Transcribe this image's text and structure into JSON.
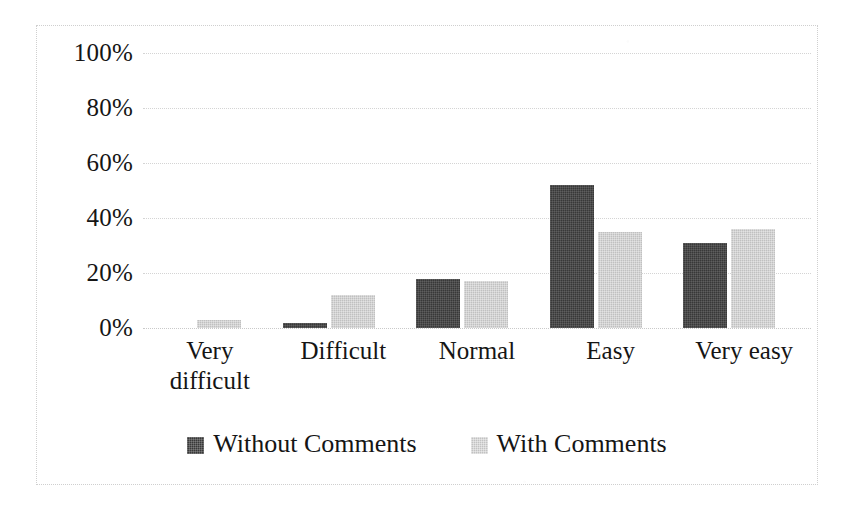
{
  "chart_data": {
    "type": "bar",
    "title": "",
    "subtitle": "",
    "xlabel": "",
    "ylabel": "",
    "categories": [
      "Very difficult",
      "Difficult",
      "Normal",
      "Easy",
      "Very easy"
    ],
    "category_lines": [
      [
        "Very",
        "difficult"
      ],
      [
        "Difficult"
      ],
      [
        "Normal"
      ],
      [
        "Easy"
      ],
      [
        "Very easy"
      ]
    ],
    "series": [
      {
        "name": "Without Comments",
        "color": "#383838",
        "values": [
          0,
          2,
          18,
          52,
          31
        ]
      },
      {
        "name": "With Comments",
        "color": "#c0c0c0",
        "values": [
          3,
          12,
          17,
          35,
          36
        ]
      }
    ],
    "ylim": [
      0,
      100
    ],
    "ytick_values": [
      100,
      80,
      60,
      40,
      20,
      0
    ],
    "ytick_labels": [
      "100%",
      "80%",
      "60%",
      "40%",
      "20%",
      "0%"
    ],
    "grid": true,
    "grid_axis": "y",
    "grid_style": "dotted",
    "grid_color": "#d4d4d4",
    "legend_position": "bottom",
    "value_unit": "%",
    "plot_background": "#ffffff",
    "border_color": "#cfcfcf",
    "border_style": "dotted"
  }
}
